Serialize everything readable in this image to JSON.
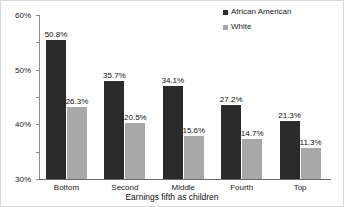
{
  "chart_data": {
    "type": "bar",
    "title": "",
    "subtitle": "",
    "xlabel": "Earnings fifth as children",
    "ylabel": "",
    "categories": [
      "Bottom",
      "Second",
      "Middle",
      "Fourth",
      "Top"
    ],
    "series": [
      {
        "name": "African American",
        "color": "#2b2b2b",
        "values": [
          50.8,
          35.7,
          34.1,
          27.2,
          21.3
        ],
        "labels": [
          "50.8%",
          "35.7%",
          "34.1%",
          "27.2%",
          "21.3%"
        ]
      },
      {
        "name": "White",
        "color": "#a8a8a8",
        "values": [
          26.3,
          20.5,
          15.6,
          14.7,
          11.3
        ],
        "labels": [
          "26.3%",
          "20.5%",
          "15.6%",
          "14.7%",
          "11.3%"
        ]
      }
    ],
    "ylim": [
      0,
      60
    ],
    "yticks": [
      0,
      10,
      20,
      30,
      40,
      50,
      60
    ],
    "ytick_labels": [
      "0%",
      "10%",
      "20%",
      "30%",
      "40%",
      "50%",
      "60%"
    ],
    "grid": false,
    "legend_position": "top-right",
    "plot_background": "#ffffff",
    "axis_color": "#8c8c8c"
  },
  "legend": {
    "entries": [
      {
        "label": "African American",
        "color": "#2b2b2b"
      },
      {
        "label": "White",
        "color": "#a8a8a8"
      }
    ]
  }
}
